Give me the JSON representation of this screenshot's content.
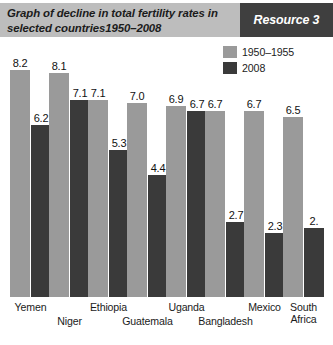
{
  "header": {
    "title": "Graph of decline in total fertility rates in selected countries1950–2008",
    "resource_label": "Resource 3"
  },
  "legend": {
    "items": [
      {
        "label": "1950–1955",
        "color": "#9a9a9a"
      },
      {
        "label": "2008",
        "color": "#3a3a3a"
      }
    ]
  },
  "chart_data": {
    "type": "bar",
    "title": "Graph of decline in total fertility rates in selected countries1950–2008",
    "xlabel": "",
    "ylabel": "",
    "ylim": [
      0,
      8.6
    ],
    "grid": false,
    "legend_position": "top-right",
    "categories": [
      "Yemen",
      "Niger",
      "Ethiopia",
      "Guatemala",
      "Uganda",
      "Bangladesh",
      "Mexico",
      "South\nAfrica"
    ],
    "series": [
      {
        "name": "1950–1955",
        "color": "#9a9a9a",
        "values": [
          8.2,
          8.1,
          7.1,
          7.0,
          6.9,
          6.7,
          6.7,
          6.5
        ],
        "labels": [
          "8.2",
          "8.1",
          "7.1",
          "7.0",
          "6.9",
          "6.7",
          "6.7",
          "6.5"
        ]
      },
      {
        "name": "2008",
        "color": "#3a3a3a",
        "values": [
          6.2,
          7.1,
          5.3,
          4.4,
          6.7,
          2.7,
          2.3,
          2.5
        ],
        "labels": [
          "6.2",
          "7.1",
          "5.3",
          "4.4",
          "6.7",
          "2.7",
          "2.3",
          "2."
        ]
      }
    ]
  },
  "colors": {
    "header_background": "#bdbdbd",
    "resource_background": "#3f3f3f",
    "series_1950": "#9a9a9a",
    "series_2008": "#3a3a3a"
  }
}
